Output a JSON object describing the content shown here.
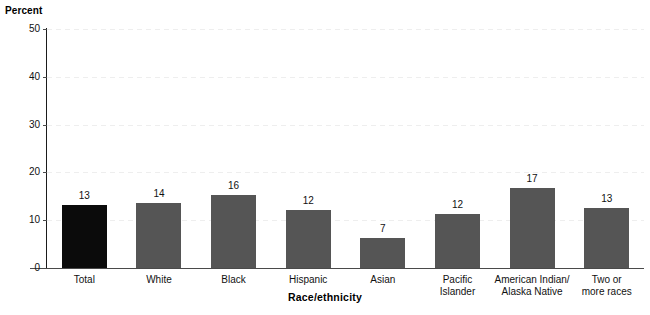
{
  "chart_data": {
    "type": "bar",
    "title": "",
    "subtitle": "",
    "xlabel": "Race/ethnicity",
    "ylabel": "Percent",
    "ylim": [
      0,
      50
    ],
    "yticks": [
      0,
      10,
      20,
      30,
      40,
      50
    ],
    "grid": true,
    "legend": "none",
    "categories": [
      "Total",
      "White",
      "Black",
      "Hispanic",
      "Asian",
      "Pacific\nIslander",
      "American Indian/\nAlaska Native",
      "Two or\nmore races"
    ],
    "values": [
      13,
      14,
      16,
      12,
      7,
      12,
      17,
      13
    ],
    "value_labels": [
      "13",
      "14",
      "16",
      "12",
      "7",
      "12",
      "17",
      "13"
    ],
    "bar_heights_plotted": [
      13.2,
      13.6,
      15.3,
      12.1,
      6.3,
      11.4,
      16.8,
      12.6
    ],
    "bar_colors": [
      "#0b0b0b",
      "#555555",
      "#555555",
      "#555555",
      "#555555",
      "#555555",
      "#555555",
      "#555555"
    ]
  },
  "axis": {
    "y_title": "Percent",
    "x_title": "Race/ethnicity",
    "tick_labels": [
      "0",
      "10",
      "20",
      "30",
      "40",
      "50"
    ]
  },
  "colors": {
    "highlight_bar": "#0b0b0b",
    "standard_bar": "#555555",
    "gridline": "#eeeeee",
    "axis": "#1b1b1b",
    "text": "#111111",
    "background": "#ffffff"
  }
}
